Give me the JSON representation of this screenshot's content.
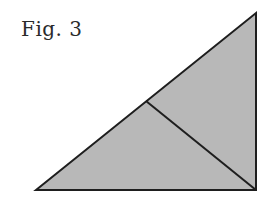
{
  "figure": {
    "label": "Fig. 3",
    "colors": {
      "fill": "#b8b8b8",
      "stroke": "#1e1e1e",
      "background": "#ffffff"
    },
    "triangle": {
      "points": [
        [
          36,
          190
        ],
        [
          256,
          13
        ],
        [
          256,
          190
        ]
      ],
      "description": "right triangle with right angle at bottom-right"
    },
    "divider": {
      "from": [
        146,
        101
      ],
      "to": [
        256,
        190
      ],
      "description": "line from hypotenuse midpoint to right-angle vertex"
    }
  }
}
